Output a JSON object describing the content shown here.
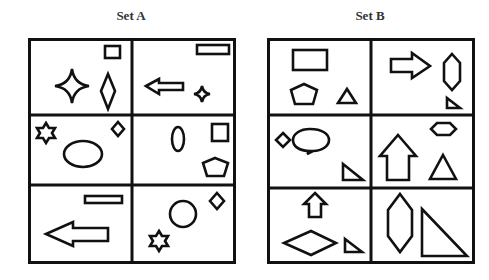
{
  "puzzle": {
    "type": "bongard",
    "set_a": {
      "title": "Set A",
      "cells": [
        {
          "row": 0,
          "col": 0,
          "shapes": [
            "rectangle-small",
            "four-point-star",
            "diamond-tall"
          ]
        },
        {
          "row": 0,
          "col": 1,
          "shapes": [
            "rectangle-wide",
            "left-arrow",
            "four-point-star-small"
          ]
        },
        {
          "row": 1,
          "col": 0,
          "shapes": [
            "six-point-star",
            "diamond",
            "ellipse"
          ]
        },
        {
          "row": 1,
          "col": 1,
          "shapes": [
            "ellipse-tall",
            "square",
            "pentagon"
          ]
        },
        {
          "row": 2,
          "col": 0,
          "shapes": [
            "rectangle-thin",
            "left-arrow-large"
          ]
        },
        {
          "row": 2,
          "col": 1,
          "shapes": [
            "diamond",
            "circle",
            "six-point-star"
          ]
        }
      ]
    },
    "set_b": {
      "title": "Set B",
      "cells": [
        {
          "row": 0,
          "col": 0,
          "shapes": [
            "rectangle",
            "pentagon",
            "triangle"
          ]
        },
        {
          "row": 0,
          "col": 1,
          "shapes": [
            "right-arrow",
            "hexagon-tall",
            "right-triangle-small"
          ]
        },
        {
          "row": 1,
          "col": 0,
          "shapes": [
            "diamond",
            "speech-bubble",
            "right-triangle"
          ]
        },
        {
          "row": 1,
          "col": 1,
          "shapes": [
            "hexagon-wide",
            "up-arrow",
            "triangle"
          ]
        },
        {
          "row": 2,
          "col": 0,
          "shapes": [
            "up-arrow-small",
            "rhombus-wide",
            "right-triangle-small"
          ]
        },
        {
          "row": 2,
          "col": 1,
          "shapes": [
            "hexagon-tall-large",
            "right-triangle-large"
          ]
        }
      ]
    },
    "colors": {
      "stroke": "#111111",
      "background": "#ffffff"
    }
  }
}
